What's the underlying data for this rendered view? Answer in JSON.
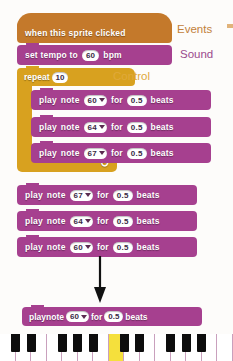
{
  "app": {
    "title": "Scratch music script with piano keyboard"
  },
  "script": {
    "hat_block": {
      "label": "when this sprite clicked",
      "category": "Events",
      "color": "#c4792b"
    },
    "tempo_block": {
      "text_before": "set tempo to",
      "value": "60",
      "text_after": "bpm",
      "category": "Sound",
      "color": "#a6408f"
    },
    "repeat_block": {
      "label": "repeat",
      "value": "10",
      "category": "Control",
      "color": "#d8a11f",
      "loop_arrow": "↻"
    },
    "inner_notes": [
      {
        "text_play": "play",
        "text_note": "note",
        "note": "60",
        "text_for": "for",
        "beats": "0.5",
        "text_beats": "beats"
      },
      {
        "text_play": "play",
        "text_note": "note",
        "note": "64",
        "text_for": "for",
        "beats": "0.5",
        "text_beats": "beats"
      },
      {
        "text_play": "play",
        "text_note": "note",
        "note": "67",
        "text_for": "for",
        "beats": "0.5",
        "text_beats": "beats"
      }
    ],
    "outer_notes": [
      {
        "text_play": "play",
        "text_note": "note",
        "note": "67",
        "text_for": "for",
        "beats": "0.5",
        "text_beats": "beats"
      },
      {
        "text_play": "play",
        "text_note": "note",
        "note": "64",
        "text_for": "for",
        "beats": "0.5",
        "text_beats": "beats"
      },
      {
        "text_play": "play",
        "text_note": "note",
        "note": "60",
        "text_for": "for",
        "beats": "0.5",
        "text_beats": "beats"
      }
    ]
  },
  "palette_labels": {
    "events": "Events",
    "sound": "Sound",
    "control": "Control"
  },
  "callout": {
    "block": {
      "text_play": "play",
      "text_note": "note",
      "note": "60",
      "text_for": "for",
      "beats": "0.5",
      "text_beats": "beats"
    },
    "arrow": "down-arrow"
  },
  "piano": {
    "highlighted_note": "60",
    "highlighted_key_label": "C",
    "white_key_count": 15,
    "black_key_count": 10,
    "highlight_color": "#f5e03c"
  }
}
